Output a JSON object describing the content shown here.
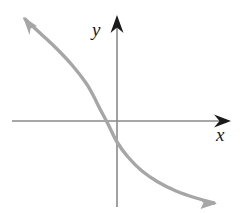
{
  "figure": {
    "kind": "coordinate-plane-graph",
    "background_color": "#ffffff",
    "width": 246,
    "height": 213
  },
  "axes": {
    "x_label": "x",
    "y_label": "y",
    "axis_color": "#8a8a8a",
    "arrowhead_color": "#1a1a1a",
    "origin": {
      "x": 117,
      "y": 121
    },
    "x_axis": {
      "start_x": 12,
      "end_x": 228,
      "y": 121,
      "arrow_at": "right"
    },
    "y_axis": {
      "x": 117,
      "start_y": 207,
      "end_y": 16,
      "arrow_at": "top"
    }
  },
  "chart_data": {
    "type": "line",
    "title": "",
    "xlabel": "x",
    "ylabel": "y",
    "grid": false,
    "legend": null,
    "annotations": [],
    "axis_ranges": {
      "xlim": [
        -3.5,
        3.5
      ],
      "ylim": [
        -2.5,
        3.5
      ]
    },
    "series": [
      {
        "name": "decreasing exponential curve",
        "color": "#a6a6a6",
        "shape": "decreasing-convex",
        "arrows": [
          "start-upper-left",
          "end-lower-right"
        ],
        "x_intercept_px": 93,
        "y_intercept_px": 142,
        "points_px": [
          [
            25,
            19
          ],
          [
            40,
            33
          ],
          [
            56,
            48
          ],
          [
            72,
            65
          ],
          [
            86,
            83
          ],
          [
            93,
            95
          ],
          [
            100,
            109
          ],
          [
            108,
            124
          ],
          [
            117,
            142
          ],
          [
            128,
            157
          ],
          [
            142,
            171
          ],
          [
            158,
            182
          ],
          [
            176,
            191
          ],
          [
            196,
            198
          ],
          [
            214,
            203
          ]
        ]
      }
    ]
  },
  "labels": {
    "x": {
      "text": "x",
      "px": [
        220,
        138
      ]
    },
    "y": {
      "text": "y",
      "px": [
        96,
        34
      ]
    }
  }
}
